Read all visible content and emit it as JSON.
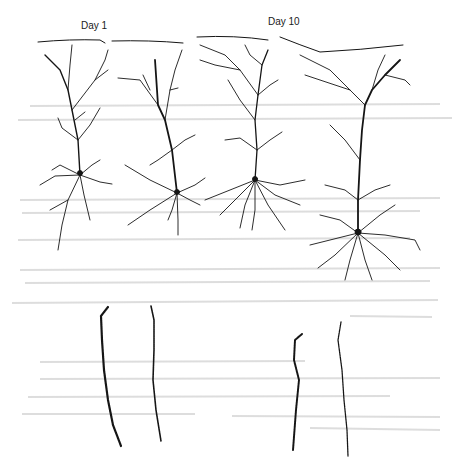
{
  "figure": {
    "labels": {
      "day1": "Day 1",
      "day10": "Day 10"
    },
    "groups": [
      {
        "name": "Day 1",
        "neurons": 2,
        "dendrite_segments": 2
      },
      {
        "name": "Day 10",
        "neurons": 2,
        "dendrite_segments": 2
      }
    ],
    "colors": {
      "ink": "#151515",
      "background": "#ffffff",
      "bleed_through": "#d4d4d4"
    }
  }
}
